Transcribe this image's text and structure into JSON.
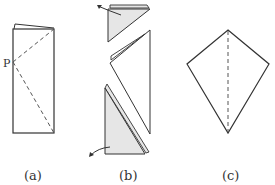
{
  "figures": [
    {
      "id": "a",
      "caption": "(a)",
      "point_label": "P",
      "description": "Folded rectangle with dashed fold lines from point P to the top-right and bottom-right corners"
    },
    {
      "id": "b",
      "caption": "(b)",
      "description": "Rectangle folded along the dashed lines; top and bottom shaded triangles folded back with curved arrows"
    },
    {
      "id": "c",
      "caption": "(c)",
      "description": "Resulting kite shape with a dashed vertical center line"
    }
  ],
  "colors": {
    "stroke": "#333333",
    "shade": "#e6e6e6",
    "dash": "#555555"
  }
}
